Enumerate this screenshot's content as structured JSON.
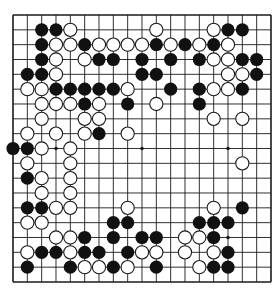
{
  "board": {
    "size": 19,
    "origin": {
      "x": 13,
      "y": 15
    },
    "spacing": {
      "x": 14.333,
      "y": 14.833
    },
    "line_color": "#1a1a1a",
    "background": "#ffffff",
    "black_color": "#111111",
    "white_fill": "#ffffff",
    "white_stroke": "#1a1a1a",
    "star_points": [
      [
        3,
        3
      ],
      [
        3,
        9
      ],
      [
        3,
        15
      ],
      [
        9,
        3
      ],
      [
        9,
        9
      ],
      [
        9,
        15
      ],
      [
        15,
        3
      ],
      [
        15,
        9
      ],
      [
        15,
        15
      ]
    ],
    "rows": [
      ".................. .",
      "..BBW.....W...WBB..",
      "..BWWBWWWWBWBWBW...",
      "..BW.WBB.B.B.BWWBB.",
      ".BBW.....BB....WWB.",
      ".WWBBBBBW..B.BWWB..",
      "..WWWBW.B.W..B.....",
      "..W..WW.......W.W..",
      ".W.W.WB.W..........",
      "BBW.W..............",
      ".W..W...........W..",
      ".BW.W..............",
      "..W.W..............",
      ".BBWW...W.....W.B..",
      ".WW....BB....BBB...",
      "...WWB.B.BB.WWB....",
      ".WBBWBB.BWW.W.WB...",
      ".B..BWWBW.B..WBB...",
      "..................."
    ]
  }
}
